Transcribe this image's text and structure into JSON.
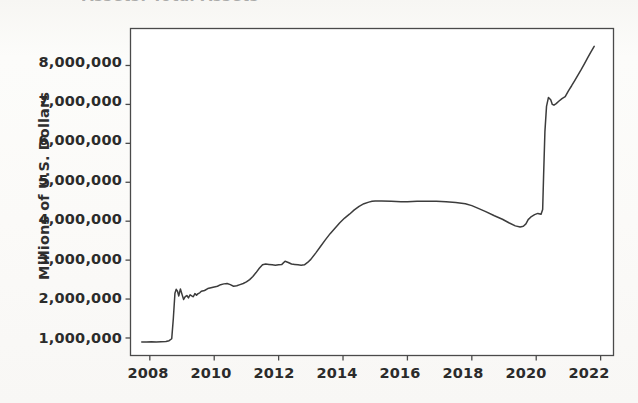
{
  "page": {
    "background_color": "#fbfbf9",
    "partial_title_above_crop": "Assets: Total Assets"
  },
  "chart_data": {
    "type": "line",
    "title": "",
    "xlabel": "",
    "ylabel": "Millions of U.S. Dollars",
    "xlim": [
      2007.4,
      2022.4
    ],
    "ylim": [
      550000,
      8950000
    ],
    "grid": false,
    "legend": null,
    "line_color": "#3c3c3c",
    "line_width": 1.5,
    "frame_color": "#4a4a4a",
    "plot_background": "#ffffff",
    "xticks": [
      2008,
      2010,
      2012,
      2014,
      2016,
      2018,
      2020,
      2022
    ],
    "xtick_labels": [
      "2008",
      "2010",
      "2012",
      "2014",
      "2016",
      "2018",
      "2020",
      "2022"
    ],
    "yticks": [
      1000000,
      2000000,
      3000000,
      4000000,
      5000000,
      6000000,
      7000000,
      8000000
    ],
    "ytick_labels": [
      "1,000,000",
      "2,000,000",
      "3,000,000",
      "4,000,000",
      "5,000,000",
      "6,000,000",
      "7,000,000",
      "8,000,000"
    ],
    "series": [
      {
        "name": "Total Assets",
        "x": [
          2007.75,
          2007.9,
          2008.05,
          2008.2,
          2008.35,
          2008.5,
          2008.6,
          2008.68,
          2008.73,
          2008.78,
          2008.82,
          2008.86,
          2008.9,
          2008.95,
          2009.0,
          2009.05,
          2009.1,
          2009.15,
          2009.2,
          2009.25,
          2009.3,
          2009.35,
          2009.4,
          2009.45,
          2009.5,
          2009.55,
          2009.6,
          2009.7,
          2009.8,
          2009.9,
          2010.0,
          2010.1,
          2010.2,
          2010.3,
          2010.4,
          2010.5,
          2010.6,
          2010.7,
          2010.8,
          2010.9,
          2011.0,
          2011.1,
          2011.2,
          2011.3,
          2011.4,
          2011.5,
          2011.6,
          2011.7,
          2011.8,
          2011.9,
          2012.0,
          2012.1,
          2012.2,
          2012.3,
          2012.4,
          2012.5,
          2012.6,
          2012.7,
          2012.8,
          2012.9,
          2013.0,
          2013.15,
          2013.3,
          2013.45,
          2013.6,
          2013.75,
          2013.9,
          2014.05,
          2014.2,
          2014.35,
          2014.5,
          2014.65,
          2014.8,
          2014.9,
          2015.0,
          2015.2,
          2015.5,
          2015.8,
          2016.0,
          2016.3,
          2016.6,
          2016.9,
          2017.2,
          2017.5,
          2017.8,
          2018.0,
          2018.2,
          2018.45,
          2018.7,
          2018.95,
          2019.15,
          2019.35,
          2019.5,
          2019.6,
          2019.68,
          2019.75,
          2019.85,
          2019.95,
          2020.05,
          2020.15,
          2020.2,
          2020.23,
          2020.27,
          2020.32,
          2020.38,
          2020.45,
          2020.5,
          2020.55,
          2020.62,
          2020.7,
          2020.8,
          2020.9,
          2021.0,
          2021.1,
          2021.2,
          2021.3,
          2021.4,
          2021.5,
          2021.6,
          2021.7,
          2021.8
        ],
        "y": [
          900000,
          898000,
          902000,
          900000,
          905000,
          910000,
          930000,
          980000,
          1500000,
          2150000,
          2250000,
          2200000,
          2080000,
          2260000,
          2120000,
          1990000,
          2060000,
          2090000,
          2030000,
          2110000,
          2080000,
          2060000,
          2140000,
          2100000,
          2140000,
          2160000,
          2200000,
          2220000,
          2270000,
          2290000,
          2310000,
          2330000,
          2370000,
          2390000,
          2400000,
          2370000,
          2330000,
          2340000,
          2370000,
          2400000,
          2440000,
          2500000,
          2580000,
          2680000,
          2790000,
          2880000,
          2900000,
          2890000,
          2880000,
          2870000,
          2880000,
          2890000,
          2970000,
          2940000,
          2900000,
          2890000,
          2880000,
          2870000,
          2880000,
          2940000,
          3020000,
          3180000,
          3350000,
          3520000,
          3680000,
          3820000,
          3960000,
          4080000,
          4180000,
          4290000,
          4380000,
          4450000,
          4490000,
          4510000,
          4520000,
          4520000,
          4510000,
          4500000,
          4500000,
          4510000,
          4510000,
          4510000,
          4500000,
          4480000,
          4450000,
          4400000,
          4330000,
          4240000,
          4140000,
          4050000,
          3960000,
          3880000,
          3850000,
          3870000,
          3930000,
          4040000,
          4120000,
          4170000,
          4200000,
          4180000,
          4300000,
          5200000,
          6300000,
          6950000,
          7180000,
          7120000,
          7000000,
          6980000,
          7020000,
          7080000,
          7150000,
          7200000,
          7350000,
          7480000,
          7620000,
          7760000,
          7900000,
          8050000,
          8200000,
          8350000,
          8490000
        ]
      }
    ],
    "annotations": [
      {
        "label": "flat near 900,000 through mid-2008"
      },
      {
        "label": "sharp jump to about 2,200,000 in late 2008"
      },
      {
        "label": "plateau near 2,900,000 during 2011-2012"
      },
      {
        "label": "plateau near 4,500,000 during 2015-2018"
      },
      {
        "label": "trough near 3,850,000 in late 2019"
      },
      {
        "label": "vertical surge to about 7,200,000 in spring 2020"
      },
      {
        "label": "ends near 8,500,000 in late 2021"
      }
    ]
  }
}
